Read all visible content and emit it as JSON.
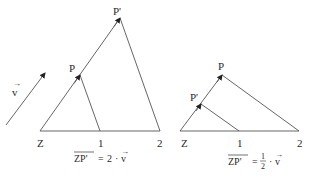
{
  "vector_label": "v",
  "left_figure": {
    "points": {
      "Z": {
        "label": "Z",
        "x": 40,
        "y": 131
      },
      "one": {
        "label": "1",
        "x": 100,
        "y": 131
      },
      "two": {
        "label": "2",
        "x": 160,
        "y": 131
      },
      "P": {
        "label": "P",
        "x": 80,
        "y": 75
      },
      "P_prime": {
        "label": "P'",
        "x": 120,
        "y": 18
      }
    },
    "formula": {
      "lhs": "ZP'",
      "equals": "=",
      "scalar": "2",
      "dot": "·",
      "rhs": "v"
    }
  },
  "right_figure": {
    "points": {
      "Z": {
        "label": "Z",
        "x": 180,
        "y": 131
      },
      "one": {
        "label": "1",
        "x": 239,
        "y": 131
      },
      "two": {
        "label": "2",
        "x": 299,
        "y": 131
      },
      "P": {
        "label": "P",
        "x": 222,
        "y": 75
      },
      "P_prime": {
        "label": "P'",
        "x": 201,
        "y": 104
      }
    },
    "formula": {
      "lhs": "ZP'",
      "equals": "=",
      "numerator": "1",
      "denominator": "2",
      "dot": "·",
      "rhs": "v"
    }
  },
  "colors": {
    "stroke": "#555555",
    "text": "#2a2a2a"
  }
}
